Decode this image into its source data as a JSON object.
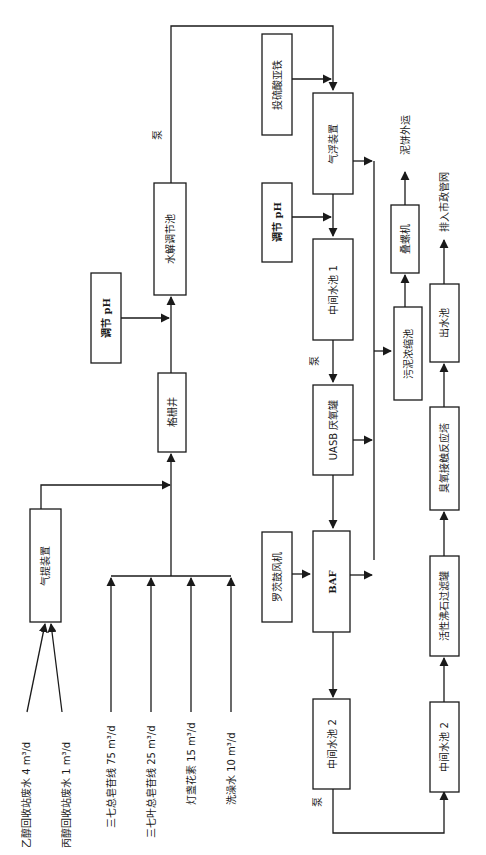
{
  "diagram": {
    "title": "",
    "orientation": "rotated-90-ccw",
    "inputs": [
      {
        "id": "ethanol",
        "label": "乙醇回收站废水 4 m³/d"
      },
      {
        "id": "propanol",
        "label": "丙醇回收站废水 1 m³/d"
      },
      {
        "id": "sanqi",
        "label": "三七总皂苷线 75 m³/d"
      },
      {
        "id": "sanqi-leaf",
        "label": "三七叶总皂苷线 25 m³/d"
      },
      {
        "id": "dengzhan",
        "label": "灯盏花素 15 m³/d"
      },
      {
        "id": "washing",
        "label": "洗澡水 10 m³/d"
      }
    ],
    "nodes": {
      "stripper": "气提装置",
      "screen_well": "格栅井",
      "ph_adjust_1": "调节 pH",
      "hydrolysis_tank": "水解调节池",
      "ferrous_sulfate": "投硫酸亚铁",
      "flotation": "气浮装置",
      "ph_adjust_2": "调节 pH",
      "mid_tank_1": "中间水池 1",
      "uasb": "UASB 厌氧罐",
      "roots_blower": "罗茨鼓风机",
      "baf": "BAF",
      "mid_tank_2a": "中间水池 2",
      "mid_tank_2b": "中间水池 2",
      "zeolite_filter": "活性沸石过滤罐",
      "ozone_tower": "臭氧接触反应塔",
      "outlet_tank": "出水池",
      "sludge_thickener": "污泥浓缩池",
      "screw_press": "叠螺机"
    },
    "annotations": {
      "pump_1": "泵",
      "pump_2": "泵",
      "pump_3": "泵",
      "sludge_out": "泥饼外运",
      "discharge": "排入市政管网"
    }
  }
}
